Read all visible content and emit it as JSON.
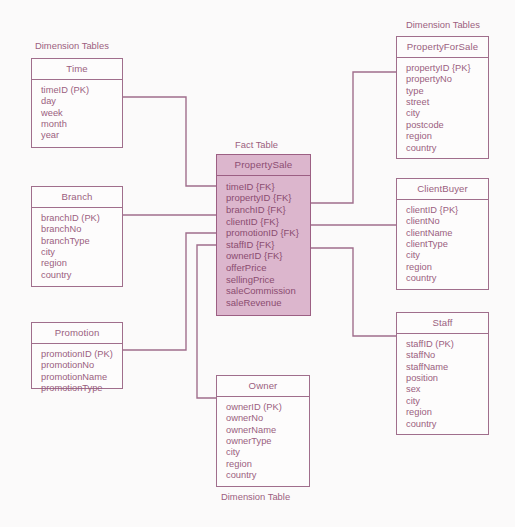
{
  "diagram": {
    "kind": "star-schema",
    "captions": [
      {
        "id": "dim-tables-left",
        "text": "Dimension Tables",
        "x": 35,
        "y": 41
      },
      {
        "id": "fact-table",
        "text": "Fact Table",
        "x": 235,
        "y": 140
      },
      {
        "id": "dim-tables-right",
        "text": "Dimension Tables",
        "x": 406,
        "y": 20
      },
      {
        "id": "dim-table-bottom",
        "text": "Dimension Table",
        "x": 221,
        "y": 492
      }
    ],
    "entities": [
      {
        "id": "time",
        "name": "Time",
        "role": "dimension",
        "x": 31,
        "y": 58,
        "w": 92,
        "h": 90,
        "fields": [
          "timeID (PK)",
          "day",
          "week",
          "month",
          "year"
        ]
      },
      {
        "id": "branch",
        "name": "Branch",
        "role": "dimension",
        "x": 31,
        "y": 186,
        "w": 92,
        "h": 101,
        "fields": [
          "branchID (PK)",
          "branchNo",
          "branchType",
          "city",
          "region",
          "country"
        ]
      },
      {
        "id": "promotion",
        "name": "Promotion",
        "role": "dimension",
        "x": 31,
        "y": 322,
        "w": 92,
        "h": 67,
        "fields": [
          "promotionID (PK)",
          "promotionNo",
          "promotionName",
          "promotionType"
        ]
      },
      {
        "id": "propertysale",
        "name": "PropertySale",
        "role": "fact",
        "x": 216,
        "y": 154,
        "w": 95,
        "h": 162,
        "fields": [
          "timeID {FK}",
          "propertyID {FK}",
          "branchID {FK}",
          "clientID {FK}",
          "promotionID {FK}",
          "staffID {FK}",
          "ownerID {FK}",
          "offerPrice",
          "sellingPrice",
          "saleCommission",
          "saleRevenue"
        ]
      },
      {
        "id": "propertyforsale",
        "name": "PropertyForSale",
        "role": "dimension",
        "x": 396,
        "y": 36,
        "w": 93,
        "h": 123,
        "fields": [
          "propertyID {PK}",
          "propertyNo",
          "type",
          "street",
          "city",
          "postcode",
          "region",
          "country"
        ]
      },
      {
        "id": "clientbuyer",
        "name": "ClientBuyer",
        "role": "dimension",
        "x": 396,
        "y": 178,
        "w": 93,
        "h": 112,
        "fields": [
          "clientID {PK}",
          "clientNo",
          "clientName",
          "clientType",
          "city",
          "region",
          "country"
        ]
      },
      {
        "id": "staff",
        "name": "Staff",
        "role": "dimension",
        "x": 396,
        "y": 312,
        "w": 93,
        "h": 123,
        "fields": [
          "staffID (PK)",
          "staffNo",
          "staffName",
          "position",
          "sex",
          "city",
          "region",
          "country"
        ]
      },
      {
        "id": "owner",
        "name": "Owner",
        "role": "dimension",
        "x": 216,
        "y": 375,
        "w": 94,
        "h": 112,
        "fields": [
          "ownerID (PK)",
          "ownerNo",
          "ownerName",
          "ownerType",
          "city",
          "region",
          "country"
        ]
      }
    ],
    "connectors": [
      {
        "id": "time-to-fact",
        "from": "time",
        "to": "propertysale",
        "points": "123,97 186,97 186,186 216,186"
      },
      {
        "id": "branch-to-fact",
        "from": "branch",
        "to": "propertysale",
        "points": "123,215 216,215"
      },
      {
        "id": "promotion-to-fact",
        "from": "promotion",
        "to": "propertysale",
        "points": "123,350 186,350 186,233 216,233"
      },
      {
        "id": "owner-to-fact",
        "from": "owner",
        "to": "propertysale",
        "points": "216,398 197,398 197,245 216,245"
      },
      {
        "id": "fact-to-propertyforsale",
        "from": "propertysale",
        "to": "propertyforsale",
        "points": "311,203 353,203 353,72 396,72"
      },
      {
        "id": "fact-to-clientbuyer",
        "from": "propertysale",
        "to": "clientbuyer",
        "points": "311,225 396,225"
      },
      {
        "id": "fact-to-staff",
        "from": "propertysale",
        "to": "staff",
        "points": "311,248 353,248 353,336 396,336"
      }
    ],
    "colors": {
      "line": "#a06e8c",
      "text": "#9b5f80",
      "fact_fill": "#dcb6cd",
      "fact_border": "#9c5f83",
      "background": "#fbfafa"
    }
  }
}
